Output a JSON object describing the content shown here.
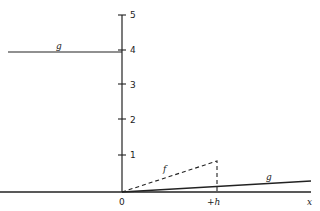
{
  "diagram": {
    "y_ticks": [
      "1",
      "2",
      "3",
      "4",
      "5"
    ],
    "x_labels": {
      "origin": "0",
      "h": "+h",
      "axis": "x"
    },
    "curve_labels": {
      "g_left": "g",
      "g_right": "g",
      "f": "f"
    }
  }
}
